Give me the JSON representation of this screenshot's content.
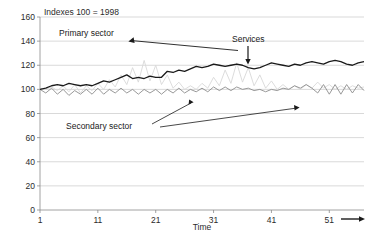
{
  "chart_data": {
    "type": "line",
    "title": "Indexes 100 = 1998",
    "xlabel": "Time",
    "ylabel": "",
    "xlim": [
      1,
      57
    ],
    "ylim": [
      0,
      160
    ],
    "ytick_labels": [
      "0",
      "20",
      "40",
      "60",
      "80",
      "100",
      "120",
      "140",
      "160"
    ],
    "yticks": [
      0,
      20,
      40,
      60,
      80,
      100,
      120,
      140,
      160
    ],
    "xtick_labels": [
      "1",
      "11",
      "21",
      "31",
      "41",
      "51"
    ],
    "xticks": [
      1,
      11,
      21,
      31,
      41,
      51
    ],
    "grid": true,
    "grid_axis": "y",
    "legend": "none",
    "axis_arrow": "time-arrow-right",
    "colors": {
      "services": "#1a1a1a",
      "secondary_sector": "#8d8d8d",
      "primary_sector": "#d8d8d8",
      "grid": "#c9c9c9",
      "axis": "#8a8a8a",
      "background": "#ffffff"
    },
    "series": [
      {
        "name": "Services",
        "color": "#1a1a1a",
        "values": [
          100,
          101,
          103,
          104,
          103,
          105,
          104,
          103,
          104,
          103,
          105,
          107,
          106,
          108,
          110,
          112,
          109,
          110,
          109,
          111,
          110,
          110,
          115,
          114,
          116,
          115,
          117,
          119,
          118,
          119,
          121,
          120,
          119,
          120,
          121,
          120,
          118,
          117,
          118,
          120,
          122,
          121,
          120,
          119,
          121,
          120,
          122,
          123,
          122,
          121,
          123,
          124,
          123,
          121,
          120,
          122,
          123
        ]
      },
      {
        "name": "Secondary sector",
        "color": "#8d8d8d",
        "values": [
          100,
          97,
          101,
          96,
          100,
          95,
          99,
          96,
          100,
          96,
          101,
          96,
          100,
          97,
          101,
          97,
          100,
          96,
          100,
          97,
          100,
          96,
          100,
          97,
          101,
          97,
          100,
          98,
          101,
          98,
          102,
          99,
          102,
          99,
          102,
          100,
          101,
          99,
          100,
          98,
          100,
          99,
          101,
          100,
          103,
          101,
          104,
          101,
          97,
          104,
          96,
          104,
          96,
          104,
          97,
          104,
          99
        ]
      },
      {
        "name": "Primary sector",
        "color": "#d8d8d8",
        "values": [
          101,
          100,
          102,
          99,
          103,
          98,
          104,
          97,
          103,
          99,
          105,
          100,
          108,
          102,
          112,
          104,
          118,
          106,
          124,
          107,
          120,
          104,
          112,
          101,
          106,
          100,
          103,
          100,
          105,
          101,
          110,
          103,
          116,
          105,
          122,
          106,
          118,
          103,
          112,
          101,
          107,
          100,
          104,
          100,
          103,
          100,
          104,
          101,
          106,
          101,
          104,
          100,
          103,
          100,
          103,
          101,
          102
        ]
      }
    ],
    "annotations": [
      {
        "id": "primary-sector",
        "text": "Primary sector",
        "points_to": "primary-sector-series"
      },
      {
        "id": "services",
        "text": "Services",
        "points_to": "services-series"
      },
      {
        "id": "secondary-sector",
        "text": "Secondary sector",
        "points_to": "secondary-sector-series"
      }
    ]
  }
}
